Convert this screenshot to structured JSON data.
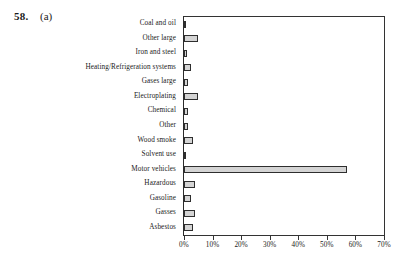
{
  "problem": {
    "number": "58.",
    "part": "(a)"
  },
  "chart_data": {
    "type": "bar",
    "orientation": "horizontal",
    "title": "",
    "xlabel": "",
    "ylabel": "",
    "xlim": [
      0,
      70
    ],
    "grid": false,
    "legend": false,
    "xticks": [
      "0%",
      "10%",
      "20%",
      "30%",
      "40%",
      "50%",
      "60%",
      "70%"
    ],
    "xtick_values": [
      0,
      10,
      20,
      30,
      40,
      50,
      60,
      70
    ],
    "categories": [
      "Coal and oil",
      "Other large",
      "Iron and steel",
      "Heating/Refrigeration systems",
      "Gases large",
      "Electroplating",
      "Chemical",
      "Other",
      "Wood smoke",
      "Solvent use",
      "Motor vehicles",
      "Hazardous",
      "Gasoline",
      "Gasses",
      "Asbestos"
    ],
    "values": [
      0.7,
      5.0,
      1.0,
      2.5,
      1.5,
      5.0,
      1.5,
      1.5,
      3.0,
      0.7,
      57.0,
      4.0,
      2.5,
      4.0,
      3.0
    ],
    "bar_fill_color": "#d4d4d4",
    "bar_edge_color": "#2e2e2e"
  }
}
